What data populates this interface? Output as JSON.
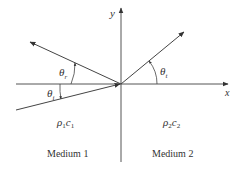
{
  "diagram": {
    "type": "acoustic-reflection-transmission",
    "axes": {
      "x_label": "x",
      "y_label": "y"
    },
    "angles": {
      "reflected": {
        "symbol": "θ",
        "subscript": "r"
      },
      "incident": {
        "symbol": "θ",
        "subscript": "i"
      },
      "transmitted": {
        "symbol": "θ",
        "subscript": "t"
      }
    },
    "media": [
      {
        "name": "Medium 1",
        "impedance_rho": "ρ",
        "impedance_rho_sub": "1",
        "impedance_c": "c",
        "impedance_c_sub": "1"
      },
      {
        "name": "Medium 2",
        "impedance_rho": "ρ",
        "impedance_rho_sub": "2",
        "impedance_c": "c",
        "impedance_c_sub": "2"
      }
    ],
    "colors": {
      "line": "#444444",
      "text": "#333333",
      "background": "#ffffff"
    }
  }
}
